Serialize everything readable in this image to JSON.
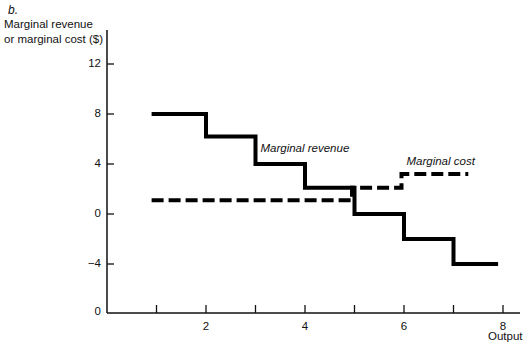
{
  "panel_label": "b.",
  "chart_data": {
    "type": "line",
    "step": true,
    "title": "",
    "panel_label": "b.",
    "xlabel": "Output",
    "ylabel": "Marginal revenue or marginal cost ($)",
    "ylabel_lines": [
      "Marginal revenue",
      "or marginal cost ($)"
    ],
    "xlim": [
      0,
      8.3
    ],
    "ylim": [
      -8,
      14
    ],
    "x_ticks": [
      1,
      2,
      3,
      4,
      5,
      6,
      7,
      8
    ],
    "x_tick_labels": [
      "",
      "2",
      "",
      "4",
      "",
      "6",
      "",
      "8"
    ],
    "y_ticks": [
      12,
      8,
      4,
      0,
      -4
    ],
    "y_tick_labels": [
      "12",
      "8",
      "4",
      "0",
      "-4"
    ],
    "origin_label": "0",
    "grid": false,
    "legend": "none (inline annotations)",
    "series": [
      {
        "name": "Marginal revenue",
        "style": "solid",
        "x_edges": [
          0.9,
          2,
          3,
          4,
          5,
          6,
          7,
          7.9
        ],
        "values": [
          8,
          6.2,
          4,
          2.1,
          0,
          -2,
          -4
        ]
      },
      {
        "name": "Marginal cost",
        "style": "dashed",
        "x_edges": [
          0.9,
          4.95,
          5.95,
          7.3
        ],
        "values": [
          1.1,
          2.1,
          3.2
        ]
      }
    ],
    "annotations": [
      {
        "text": "Marginal revenue",
        "x": 3.1,
        "y": 5.1
      },
      {
        "text": "Marginal cost",
        "x": 6.05,
        "y": 4.1
      }
    ]
  }
}
